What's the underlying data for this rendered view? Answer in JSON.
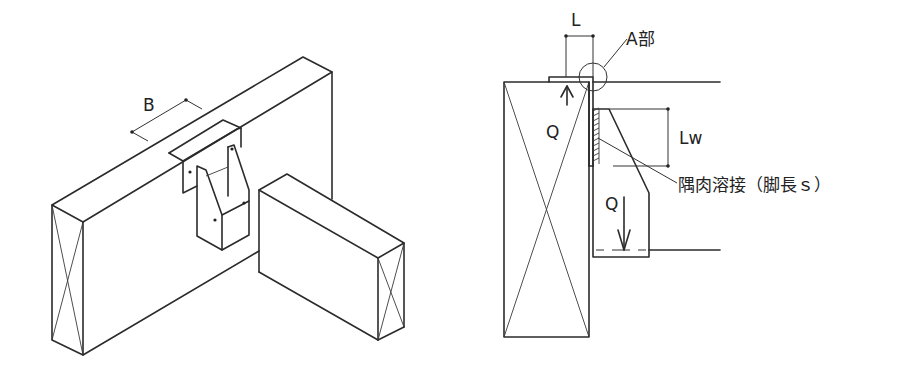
{
  "figures": {
    "left": {
      "title": "Isometric view of joist hanger connection",
      "dimension_label": "B"
    },
    "right": {
      "title": "Section view of joist hanger",
      "dimension_L": "L",
      "detail_label": "A部",
      "dimension_Lw": "Lw",
      "force_up": "Q",
      "force_down": "Q",
      "weld_label": "隅肉溶接（脚長ｓ）"
    }
  },
  "colors": {
    "line": "#2b2b2b",
    "background": "#ffffff"
  }
}
